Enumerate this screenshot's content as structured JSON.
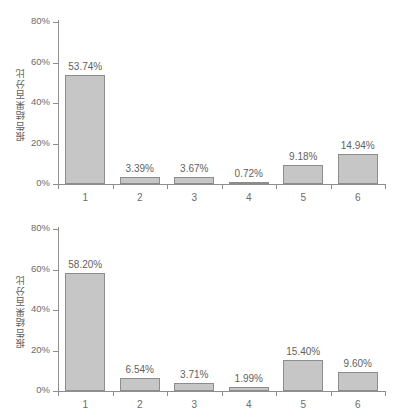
{
  "chart_data": [
    {
      "type": "bar",
      "panel": "top",
      "title": "",
      "xlabel": "",
      "ylabel": "报告结果百分比",
      "categories": [
        "1",
        "2",
        "3",
        "4",
        "5",
        "6"
      ],
      "values": [
        53.74,
        3.39,
        3.67,
        0.72,
        9.18,
        14.94
      ],
      "data_labels": [
        "53.74%",
        "3.39%",
        "3.67%",
        "0.72%",
        "9.18%",
        "14.94%"
      ],
      "ytick_values": [
        0,
        20,
        40,
        60,
        80
      ],
      "ytick_labels": [
        "0%",
        "20%",
        "40%",
        "60%",
        "80%"
      ],
      "ylim": [
        0,
        80
      ],
      "grid": false,
      "legend": false,
      "bar_fill": "#c6c6c6",
      "bar_edge": "#8c8c8c",
      "axis_color": "#8e8e8e",
      "text_color": "#6b6b6b"
    },
    {
      "type": "bar",
      "panel": "bottom",
      "title": "",
      "xlabel": "",
      "ylabel": "报告结果百分比",
      "categories": [
        "1",
        "2",
        "3",
        "4",
        "5",
        "6"
      ],
      "values": [
        58.2,
        6.54,
        3.71,
        1.99,
        15.4,
        9.6
      ],
      "data_labels": [
        "58.20%",
        "6.54%",
        "3.71%",
        "1.99%",
        "15.40%",
        "9.60%"
      ],
      "ytick_values": [
        0,
        20,
        40,
        60,
        80
      ],
      "ytick_labels": [
        "0%",
        "20%",
        "40%",
        "60%",
        "80%"
      ],
      "ylim": [
        0,
        80
      ],
      "grid": false,
      "legend": false,
      "bar_fill": "#c6c6c6",
      "bar_edge": "#8c8c8c",
      "axis_color": "#8e8e8e",
      "text_color": "#6b6b6b"
    }
  ]
}
